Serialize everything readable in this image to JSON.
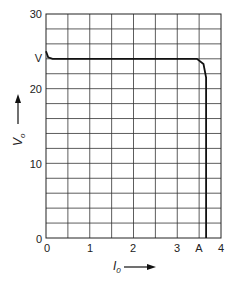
{
  "chart_data": {
    "type": "line",
    "title": "",
    "xlabel": "I_0",
    "ylabel": "V_o",
    "xlim": [
      0,
      4
    ],
    "ylim": [
      0,
      30
    ],
    "grid": true,
    "x_ticks": [
      "0",
      "1",
      "2",
      "3",
      "4"
    ],
    "y_ticks": [
      "0",
      "10",
      "20",
      "30"
    ],
    "annotations": [
      {
        "text": "V",
        "axis": "y",
        "value": 24
      },
      {
        "text": "A",
        "axis": "x",
        "value": 3.6
      }
    ],
    "series": [
      {
        "name": "V_o vs I_0",
        "x": [
          0,
          0.05,
          0.15,
          1,
          2,
          3,
          3.45,
          3.6,
          3.66,
          3.66
        ],
        "y": [
          25,
          24.2,
          24,
          24,
          24,
          24,
          24,
          23.3,
          21.5,
          0
        ]
      }
    ]
  },
  "labels": {
    "y30": "30",
    "y20": "20",
    "y10": "10",
    "y0": "0",
    "x0": "0",
    "x1": "1",
    "x2": "2",
    "x3": "3",
    "x4": "4",
    "v_marker": "V",
    "a_marker": "A",
    "xaxis_main": "I",
    "xaxis_sub": "0",
    "yaxis_main": "V",
    "yaxis_sub": "o"
  }
}
